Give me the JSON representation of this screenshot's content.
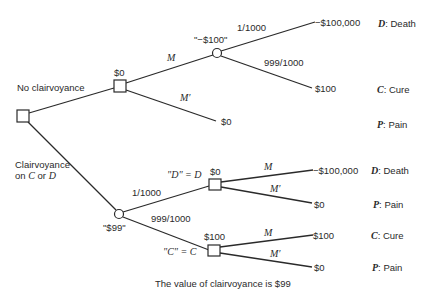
{
  "branches": {
    "no_clairvoyance": "No clairvoyance",
    "clairvoyance_line1": "Clairvoyance",
    "clairvoyance_line2_prefix": "on ",
    "clairvoyance_c": "C",
    "clairvoyance_or": " or ",
    "clairvoyance_d": "D"
  },
  "nodes": {
    "decision_no_clair_value": "$0",
    "chance_no_clair_value": "\"−$100\"",
    "chance_clair_value": "\"$99\"",
    "decision_d_value": "$0",
    "decision_d_label": "\"D\" = D",
    "decision_c_value": "$100",
    "decision_c_label": "\"C\" = C"
  },
  "edges": {
    "m": "M",
    "m_prime": "M′",
    "p_death": "1/1000",
    "p_cure": "999/1000"
  },
  "outcomes": {
    "top": [
      {
        "value": "−$100,000",
        "code": "D",
        "label": ": Death"
      },
      {
        "value": "$100",
        "code": "C",
        "label": ": Cure"
      },
      {
        "value": "$0",
        "code": "P",
        "label": ": Pain"
      }
    ],
    "bottom": [
      {
        "value": "−$100,000",
        "code": "D",
        "label": ": Death"
      },
      {
        "value": "$0",
        "code": "P",
        "label": ": Pain"
      },
      {
        "value": "$100",
        "code": "C",
        "label": ": Cure"
      },
      {
        "value": "$0",
        "code": "P",
        "label": ": Pain"
      }
    ]
  },
  "caption": "The value of clairvoyance is $99"
}
